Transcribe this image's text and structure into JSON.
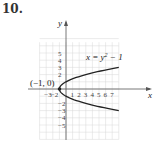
{
  "problem_number": "10.",
  "chart_data": {
    "type": "line",
    "title": "",
    "equation_label": "x = y² − 1",
    "equation_parts": {
      "lhs": "x = y",
      "exp": "2",
      "rhs": " − 1"
    },
    "point_label": "(−1, 0)",
    "xlabel": "x",
    "ylabel": "y",
    "xlim": [
      -4,
      8
    ],
    "ylim": [
      -6,
      6
    ],
    "x_ticks": [
      "-3",
      "-2",
      "1",
      "2",
      "3",
      "4",
      "5",
      "6",
      "7"
    ],
    "y_ticks": [
      "5",
      "4",
      "3",
      "2",
      "-2",
      "-3",
      "-4",
      "-5"
    ],
    "grid": true,
    "series": [
      {
        "name": "x = y^2 - 1",
        "points": [
          [
            8,
            3
          ],
          [
            3,
            2
          ],
          [
            0,
            1
          ],
          [
            -1,
            0
          ],
          [
            0,
            -1
          ],
          [
            3,
            -2
          ],
          [
            8,
            -3
          ]
        ]
      }
    ],
    "annotations": [
      {
        "text": "(−1, 0)",
        "x": -1,
        "y": 0
      }
    ]
  }
}
